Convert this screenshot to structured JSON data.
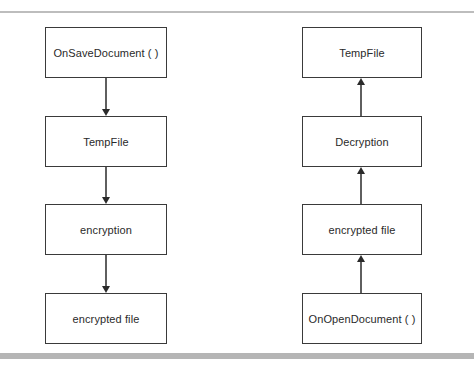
{
  "diagram": {
    "left_flow": {
      "title": "save flow",
      "nodes": [
        {
          "label": "OnSaveDocument ( )"
        },
        {
          "label": "TempFile"
        },
        {
          "label": "encryption"
        },
        {
          "label": "encrypted file"
        }
      ],
      "direction": "down"
    },
    "right_flow": {
      "title": "open flow",
      "nodes": [
        {
          "label": "TempFile"
        },
        {
          "label": "Decryption"
        },
        {
          "label": "encrypted file"
        },
        {
          "label": "OnOpenDocument ( )"
        }
      ],
      "direction": "up"
    },
    "colors": {
      "border": "#3a3a3a",
      "text": "#2a2a2a",
      "rule": "#bdbdbd"
    }
  }
}
